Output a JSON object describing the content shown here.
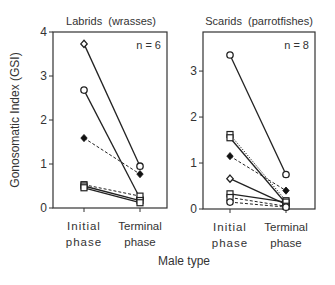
{
  "figure": {
    "y_axis_label": "Gonosomatic Index (GSI)",
    "x_axis_label": "Male type"
  },
  "chart_data": [
    {
      "type": "line",
      "title": "Labrids  (wrasses)",
      "annotation": "n = 6",
      "categories": [
        "Initial phase",
        "Terminal phase"
      ],
      "category_lines": [
        [
          "Initial",
          "phase"
        ],
        [
          "Terminal",
          "phase"
        ]
      ],
      "ylabel": "Gonosomatic Index (GSI)",
      "xlabel": "Male type",
      "ylim": [
        0,
        4
      ],
      "yticks": [
        0,
        1,
        2,
        3,
        4
      ],
      "grid": false,
      "series": [
        {
          "name": "species-1",
          "marker": "open-diamond",
          "line": "solid",
          "values": [
            3.73,
            0.95
          ]
        },
        {
          "name": "species-2",
          "marker": "open-circle",
          "line": "solid",
          "values": [
            2.68,
            0.22
          ]
        },
        {
          "name": "species-3",
          "marker": "filled-diamond",
          "line": "dashed",
          "values": [
            1.59,
            0.77
          ]
        },
        {
          "name": "species-4",
          "marker": "open-square",
          "line": "dashed",
          "values": [
            0.53,
            0.27
          ]
        },
        {
          "name": "species-5",
          "marker": "open-square",
          "line": "solid",
          "values": [
            0.5,
            0.17
          ]
        },
        {
          "name": "species-6",
          "marker": "open-square",
          "line": "solid",
          "values": [
            0.46,
            0.12
          ]
        }
      ]
    },
    {
      "type": "line",
      "title": "Scarids  (parrotfishes)",
      "annotation": "n = 8",
      "categories": [
        "Initial phase",
        "Terminal phase"
      ],
      "category_lines": [
        [
          "Initial",
          "phase"
        ],
        [
          "Terminal",
          "phase"
        ]
      ],
      "ylabel": "Gonosomatic Index (GSI)",
      "xlabel": "Male type",
      "ylim": [
        0,
        3.85
      ],
      "yticks": [
        0,
        1,
        2,
        3
      ],
      "grid": false,
      "series": [
        {
          "name": "species-1",
          "marker": "open-circle",
          "line": "solid",
          "values": [
            3.35,
            0.75
          ]
        },
        {
          "name": "species-2",
          "marker": "open-square",
          "line": "dotted",
          "values": [
            1.62,
            0.18
          ]
        },
        {
          "name": "species-3",
          "marker": "open-square",
          "line": "solid",
          "values": [
            1.55,
            0.12
          ]
        },
        {
          "name": "species-4",
          "marker": "filled-diamond",
          "line": "dashed",
          "values": [
            1.15,
            0.4
          ]
        },
        {
          "name": "species-5",
          "marker": "open-diamond",
          "line": "solid",
          "values": [
            0.66,
            0.1
          ]
        },
        {
          "name": "species-6",
          "marker": "open-square",
          "line": "solid",
          "values": [
            0.33,
            0.15
          ]
        },
        {
          "name": "species-7",
          "marker": "open-square",
          "line": "dashed",
          "values": [
            0.25,
            0.06
          ]
        },
        {
          "name": "species-8",
          "marker": "open-circle",
          "line": "dashed",
          "values": [
            0.15,
            0.04
          ]
        }
      ]
    }
  ]
}
